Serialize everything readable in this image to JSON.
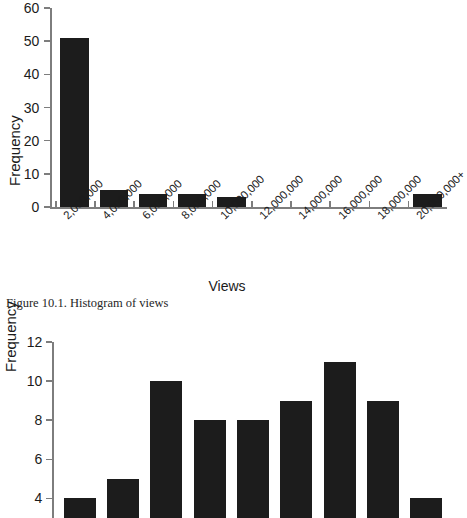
{
  "figures": [
    {
      "caption": "Figure 10.1. Histogram of views",
      "axis_title_x": "Views",
      "axis_title_y": "Frequency"
    },
    {
      "axis_title_y": "Frequency"
    }
  ],
  "chart_data": [
    {
      "type": "bar",
      "title": "",
      "caption": "Figure 10.1. Histogram of views",
      "xlabel": "Views",
      "ylabel": "Frequency",
      "categories": [
        "2,000,000",
        "4,000,000",
        "6,000,000",
        "8,000,000",
        "10,000,000",
        "12,000,000",
        "14,000,000",
        "16,000,000",
        "18,000,000",
        "20,000,000+"
      ],
      "values": [
        51,
        5,
        4,
        4,
        3,
        0,
        0,
        0,
        0,
        4
      ],
      "ylim": [
        0,
        60
      ],
      "yticks": [
        0,
        10,
        20,
        30,
        40,
        50,
        60
      ],
      "grid": false,
      "legend": null,
      "bar_color": "#1c1c1c"
    },
    {
      "type": "bar",
      "title": "",
      "xlabel": "",
      "ylabel": "Frequency",
      "categories": [
        "1",
        "2",
        "3",
        "4",
        "5",
        "6",
        "7",
        "8",
        "9"
      ],
      "values": [
        4,
        5,
        10,
        8,
        8,
        9,
        11,
        9,
        4
      ],
      "ylim": [
        3,
        12
      ],
      "yticks": [
        4,
        6,
        8,
        10,
        12
      ],
      "ytick_labels": [
        "4",
        "6",
        "8",
        "10",
        "12"
      ],
      "grid": false,
      "legend": null,
      "bar_color": "#1c1c1c",
      "note": "cropped at bottom edge of screenshot"
    }
  ]
}
